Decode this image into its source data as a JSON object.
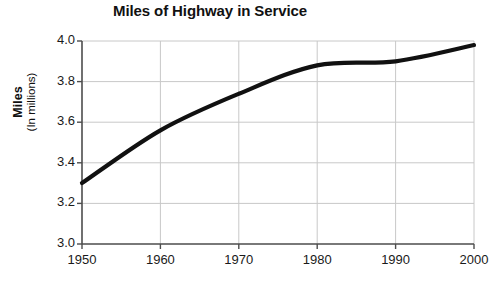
{
  "chart_data": {
    "type": "line",
    "title": "Miles of Highway in Service",
    "xlabel": "",
    "ylabel": "Miles (In millions)",
    "ylabel_main": "Miles",
    "ylabel_sub": "(In millions)",
    "x": [
      1950,
      1960,
      1970,
      1980,
      1990,
      2000
    ],
    "categories": [
      "1950",
      "1960",
      "1970",
      "1980",
      "1990",
      "2000"
    ],
    "values": [
      3.3,
      3.56,
      3.74,
      3.88,
      3.9,
      3.98
    ],
    "series": [
      {
        "name": "Miles of Highway in Service",
        "values": [
          3.3,
          3.56,
          3.74,
          3.88,
          3.9,
          3.98
        ]
      }
    ],
    "xlim": [
      1950,
      2000
    ],
    "ylim": [
      3.0,
      4.0
    ],
    "ytick_labels": [
      "4.0",
      "3.8",
      "3.6",
      "3.4",
      "3.2",
      "3.0"
    ],
    "ytick_values": [
      4.0,
      3.8,
      3.6,
      3.4,
      3.2,
      3.0
    ],
    "xtick_labels": [
      "1950",
      "1960",
      "1970",
      "1980",
      "1990",
      "2000"
    ],
    "grid": true,
    "legend": false,
    "line_color": "#111111",
    "grid_color": "#c8c8c8",
    "axis_color": "#4d4d4d",
    "background": "#ffffff"
  }
}
